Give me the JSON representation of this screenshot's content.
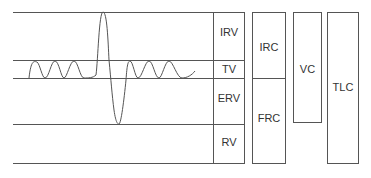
{
  "diagram": {
    "volumes": [
      {
        "id": "irv",
        "label": "IRV"
      },
      {
        "id": "tv",
        "label": "TV"
      },
      {
        "id": "erv",
        "label": "ERV"
      },
      {
        "id": "rv",
        "label": "RV"
      }
    ],
    "capacities": [
      {
        "id": "irc",
        "label": "IRC"
      },
      {
        "id": "frc",
        "label": "FRC"
      },
      {
        "id": "vc",
        "label": "VC"
      },
      {
        "id": "tlc",
        "label": "TLC"
      }
    ],
    "colors": {
      "line": "#555555",
      "text": "#333333",
      "background": "#ffffff"
    }
  }
}
